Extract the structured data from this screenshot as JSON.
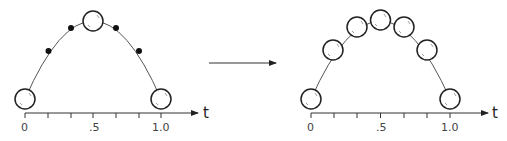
{
  "diagram": {
    "left": {
      "axis_label": "t",
      "tick_labels": [
        "0",
        ".5",
        "1.0"
      ],
      "keyframes_t": [
        0,
        0.5,
        1.0
      ],
      "inbetween_dots_t": [
        0.1667,
        0.3333,
        0.6667,
        0.8333
      ]
    },
    "right": {
      "axis_label": "t",
      "tick_labels": [
        "0",
        ".5",
        "1.0"
      ],
      "balls_t": [
        0,
        0.1667,
        0.3333,
        0.5,
        0.6667,
        0.8333,
        1.0
      ]
    },
    "transition_arrow": "right-arrow",
    "colors": {
      "stroke": "#222222",
      "curve": "#555555",
      "background": "#ffffff"
    }
  }
}
